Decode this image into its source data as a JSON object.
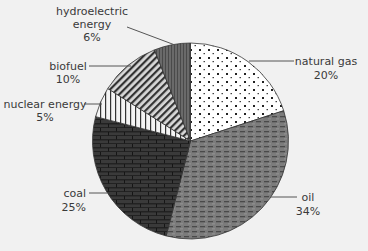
{
  "chart_data": {
    "type": "pie",
    "title": "",
    "start_angle_deg": 0,
    "direction": "clockwise",
    "center": [
      190.5,
      141
    ],
    "radius": 98,
    "slices": [
      {
        "name": "natural gas",
        "value": 20,
        "label_lines": [
          "natural gas",
          "20%"
        ],
        "pattern": "dots",
        "color": "#ffffff"
      },
      {
        "name": "oil",
        "value": 34,
        "label_lines": [
          "oil",
          "34%"
        ],
        "pattern": "dashes",
        "color": "#7a7a7a"
      },
      {
        "name": "coal",
        "value": 25,
        "label_lines": [
          "coal",
          "25%"
        ],
        "pattern": "bricks",
        "color": "#2b2b2b"
      },
      {
        "name": "nuclear energy",
        "value": 5,
        "label_lines": [
          "nuclear energy",
          "5%"
        ],
        "pattern": "vertical-stripes",
        "color": "#eeeeee"
      },
      {
        "name": "biofuel",
        "value": 10,
        "label_lines": [
          "biofuel",
          "10%"
        ],
        "pattern": "diagonal-stripes",
        "color": "#9a9a9a"
      },
      {
        "name": "hydroelectric energy",
        "value": 6,
        "label_lines": [
          "hydroelectric",
          "energy",
          "6%"
        ],
        "pattern": "fine-vertical",
        "color": "#5e5e5e"
      }
    ],
    "categories": [
      "natural gas",
      "oil",
      "coal",
      "nuclear energy",
      "biofuel",
      "hydroelectric energy"
    ],
    "values": [
      20,
      34,
      25,
      5,
      10,
      6
    ],
    "unit": "%",
    "legend": "none (direct labels with leader lines)"
  },
  "labels": {
    "natural_gas": {
      "name": "natural gas",
      "pct": "20%"
    },
    "oil": {
      "name": "oil",
      "pct": "34%"
    },
    "coal": {
      "name": "coal",
      "pct": "25%"
    },
    "nuclear": {
      "name": "nuclear energy",
      "pct": "5%"
    },
    "biofuel": {
      "name": "biofuel",
      "pct": "10%"
    },
    "hydro": {
      "line1": "hydroelectric",
      "line2": "energy",
      "pct": "6%"
    }
  }
}
